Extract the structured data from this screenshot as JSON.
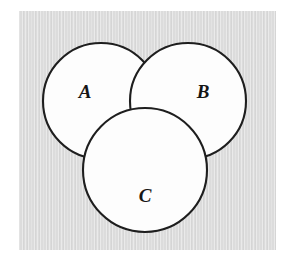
{
  "figure": {
    "kind": "venn-diagram",
    "background_color": "#ffffff",
    "plate_color": "#dcdcdc",
    "circle_fill": "#fdfdfd",
    "circle_stroke": "#1e1e1e",
    "label_color": "#161616"
  },
  "chart_data": {
    "type": "diagram",
    "subtype": "venn",
    "title": "",
    "xlabel": "",
    "ylabel": "",
    "grid": false,
    "legend": "none",
    "sets": [
      {
        "label": "A",
        "cx": 101,
        "cy": 101,
        "r": 58,
        "label_x": 85,
        "label_y": 94
      },
      {
        "label": "B",
        "cx": 188,
        "cy": 101,
        "r": 58,
        "label_x": 203,
        "label_y": 94
      },
      {
        "label": "C",
        "cx": 145,
        "cy": 170,
        "r": 62,
        "label_x": 145,
        "label_y": 198
      }
    ],
    "regions": [
      "A only",
      "B only",
      "C only",
      "A and B",
      "A and C",
      "B and C",
      "A and B and C"
    ]
  },
  "plate": {
    "x": 19,
    "y": 11,
    "width": 257,
    "height": 239
  }
}
